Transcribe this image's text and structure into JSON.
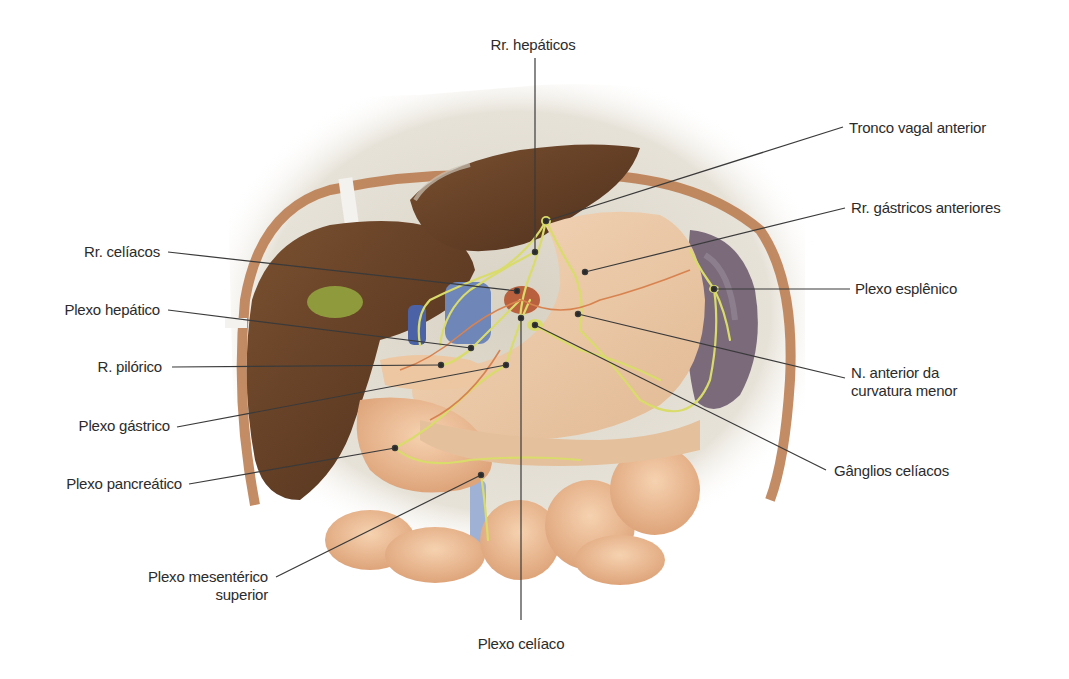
{
  "figure": {
    "colors": {
      "background": "#ffffff",
      "label_text": "#2b2b2b",
      "leader_line": "#3a3a3a",
      "liver": "#6b4226",
      "stomach": "#ecc9a6",
      "intestine": "#eab98f",
      "nerve": "#d9dc6a",
      "vein": "#6f86b8",
      "spleen": "#7a6a7a",
      "gallbladder": "#8f9a3c",
      "diaphragm_wall": "#d8d2c4"
    }
  },
  "labels": {
    "rr_hepaticos": {
      "text": "Rr. hepáticos",
      "x": 533,
      "y": 35
    },
    "tronco_vagal_anterior": {
      "text": "Tronco vagal anterior",
      "x": 849,
      "y": 118
    },
    "rr_gastricos_anteriores": {
      "text": "Rr. gástricos anteriores",
      "x": 851,
      "y": 198
    },
    "plexo_esplenico": {
      "text": "Plexo esplênico",
      "x": 855,
      "y": 279
    },
    "n_anterior_curvatura_menor_line1": {
      "text": "N. anterior da",
      "x": 851,
      "y": 363
    },
    "n_anterior_curvatura_menor_line2": {
      "text": "curvatura menor",
      "x": 851,
      "y": 381
    },
    "ganglios_celiacos": {
      "text": "Gânglios celíacos",
      "x": 834,
      "y": 461
    },
    "rr_celiacos": {
      "text": "Rr. celíacos",
      "x": 160,
      "y": 242
    },
    "plexo_hepatico": {
      "text": "Plexo hepático",
      "x": 160,
      "y": 300
    },
    "r_pilorico": {
      "text": "R. pilórico",
      "x": 162,
      "y": 357
    },
    "plexo_gastrico": {
      "text": "Plexo gástrico",
      "x": 170,
      "y": 416
    },
    "plexo_pancreatico": {
      "text": "Plexo pancreático",
      "x": 182,
      "y": 474
    },
    "plexo_mesenterico_superior_line1": {
      "text": "Plexo mesentérico",
      "x": 268,
      "y": 567
    },
    "plexo_mesenterico_superior_line2": {
      "text": "superior",
      "x": 268,
      "y": 585
    },
    "plexo_celiaco": {
      "text": "Plexo celíaco",
      "x": 521,
      "y": 634
    }
  },
  "leader_lines": [
    {
      "name": "rr-hepaticos",
      "x1": 535,
      "y1": 58,
      "x2": 535,
      "y2": 252
    },
    {
      "name": "tronco-vagal-anterior",
      "x1": 843,
      "y1": 127,
      "x2": 546,
      "y2": 221
    },
    {
      "name": "rr-gastricos-anteriores",
      "x1": 845,
      "y1": 208,
      "x2": 585,
      "y2": 272
    },
    {
      "name": "plexo-esplenico",
      "x1": 850,
      "y1": 289,
      "x2": 714,
      "y2": 289
    },
    {
      "name": "n-anterior-curvatura-menor",
      "x1": 845,
      "y1": 378,
      "x2": 578,
      "y2": 314
    },
    {
      "name": "ganglios-celiacos",
      "x1": 826,
      "y1": 470,
      "x2": 535,
      "y2": 325
    },
    {
      "name": "plexo-celiaco",
      "x1": 521,
      "y1": 620,
      "x2": 521,
      "y2": 318
    },
    {
      "name": "rr-celiacos",
      "x1": 168,
      "y1": 252,
      "x2": 517,
      "y2": 291
    },
    {
      "name": "plexo-hepatico",
      "x1": 168,
      "y1": 310,
      "x2": 471,
      "y2": 348
    },
    {
      "name": "r-pilorico",
      "x1": 172,
      "y1": 367,
      "x2": 441,
      "y2": 365
    },
    {
      "name": "plexo-gastrico",
      "x1": 177,
      "y1": 427,
      "x2": 506,
      "y2": 365
    },
    {
      "name": "plexo-pancreatico",
      "x1": 189,
      "y1": 484,
      "x2": 395,
      "y2": 448
    },
    {
      "name": "plexo-mesenterico-superior",
      "x1": 276,
      "y1": 577,
      "x2": 481,
      "y2": 475
    }
  ]
}
